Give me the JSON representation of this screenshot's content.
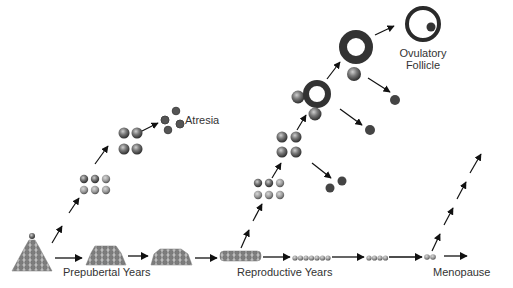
{
  "diagram": {
    "labels": {
      "atresia": "Atresia",
      "ovulatory_follicle_line1": "Ovulatory",
      "ovulatory_follicle_line2": "Follicle",
      "prepubertal": "Prepubertal Years",
      "reproductive": "Reproductive Years",
      "menopause": "Menopause"
    },
    "stages": [
      {
        "name": "birth-pool",
        "shape": "pyramid"
      },
      {
        "name": "prepubertal-pool-1",
        "shape": "mound"
      },
      {
        "name": "prepubertal-pool-2",
        "shape": "mound"
      },
      {
        "name": "reproductive-pool-1",
        "shape": "band"
      },
      {
        "name": "reproductive-pool-2",
        "shape": "row",
        "count": 7
      },
      {
        "name": "reproductive-pool-3",
        "shape": "row",
        "count": 4
      },
      {
        "name": "menopause-pool",
        "shape": "row",
        "count": 2
      }
    ],
    "colors": {
      "follicle_dark": "#3a3a3a",
      "follicle_mid": "#777777",
      "follicle_light": "#a8a8a8",
      "arrow": "#111111",
      "text": "#333333"
    }
  }
}
